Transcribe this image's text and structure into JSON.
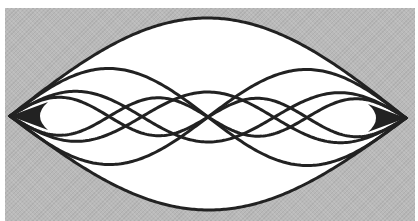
{
  "diagram": {
    "type": "standing-wave-modes",
    "colors": {
      "background_panel": "#b9b9b9",
      "envelope_fill": "#ffffff",
      "stroke": "#222222"
    },
    "geometry": {
      "left_node": [
        10,
        116
      ],
      "right_node": [
        406,
        118
      ],
      "center_line_y": 117
    },
    "modes": [
      {
        "n": 1,
        "amplitude_top": 99,
        "amplitude_bottom": 93,
        "signs": [
          "+",
          "-"
        ]
      },
      {
        "n": 2,
        "amplitude": 48,
        "signs": [
          "+",
          "-"
        ]
      },
      {
        "n": 3,
        "amplitude": 25,
        "signs": [
          "+",
          "-"
        ]
      },
      {
        "n": 4,
        "amplitude": 19,
        "signs": [
          "+",
          "-"
        ]
      }
    ]
  }
}
